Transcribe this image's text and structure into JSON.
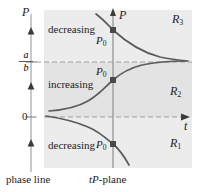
{
  "figure": {
    "background_color": "#ffffff",
    "panel_color": "#ebebeb",
    "panel_band_color": "#e2e2e2",
    "axis_color": "#808080",
    "curve_color": "#595959",
    "text_color": "#1c1c1c",
    "dashed_color": "#9a9a9a",
    "marker_color": "#4d4d4d"
  },
  "phase_line": {
    "axis_label": "P",
    "equilibrium_upper_numerator": "a",
    "equilibrium_upper_denominator": "b",
    "equilibrium_lower": "0",
    "caption": "phase line",
    "flow_arrows": [
      {
        "direction": "up",
        "region": "below-zero"
      },
      {
        "direction": "up",
        "region": "between"
      },
      {
        "direction": "up",
        "region": "above-a-over-b"
      }
    ]
  },
  "plane": {
    "caption_italic": "tP",
    "caption_rest": "-plane",
    "vertical_axis_label": "P",
    "horizontal_axis_label": "t",
    "regions": [
      {
        "name": "R",
        "index": "3",
        "label": "R₃"
      },
      {
        "name": "R",
        "index": "2",
        "label": "R₂"
      },
      {
        "name": "R",
        "index": "1",
        "label": "R₁"
      }
    ],
    "behaviour_labels": [
      {
        "text": "decreasing",
        "region": "R3"
      },
      {
        "text": "increasing",
        "region": "R2"
      },
      {
        "text": "decreasing",
        "region": "R1"
      }
    ],
    "initial_points": [
      {
        "label": "P",
        "sub": "0",
        "region": "R3"
      },
      {
        "label": "P",
        "sub": "0",
        "region": "R2"
      },
      {
        "label": "P",
        "sub": "0",
        "region": "R1"
      }
    ],
    "asymptotes": [
      {
        "label": "a/b",
        "style": "dashed"
      },
      {
        "label": "0",
        "style": "dashed"
      }
    ]
  }
}
